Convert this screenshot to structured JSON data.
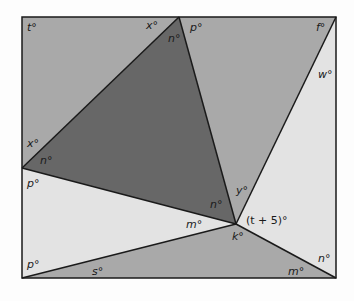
{
  "colors": {
    "dark": "#676767",
    "medium": "#a9a9a9",
    "light": "#e3e3e3",
    "stroke": "#1a1a1a"
  },
  "vertices": {
    "top_left": [
      22,
      17
    ],
    "top_apex": [
      179,
      17
    ],
    "top_right": [
      336,
      17
    ],
    "left": [
      22,
      168
    ],
    "center": [
      236,
      224
    ],
    "bottom_left": [
      22,
      278
    ],
    "bottom_right": [
      336,
      278
    ]
  },
  "labels": {
    "t": "t°",
    "x_top": "x°",
    "n_top": "n°",
    "p_top": "p°",
    "f": "f°",
    "w": "w°",
    "x_left": "x°",
    "n_left": "n°",
    "p_left_upper": "p°",
    "y": "y°",
    "n_center": "n°",
    "m_center": "m°",
    "t_plus_5": "(t + 5)°",
    "k": "k°",
    "p_left_lower": "p°",
    "s": "s°",
    "m_bottom": "m°",
    "n_right": "n°"
  }
}
